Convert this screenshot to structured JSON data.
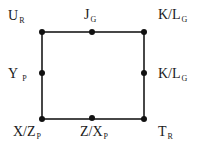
{
  "diagram": {
    "type": "square-lattice",
    "line_color": "#1a1a1a",
    "node_color": "#111111",
    "nodes": [
      {
        "id": "top-left",
        "x": 42,
        "y": 32
      },
      {
        "id": "top-mid",
        "x": 92,
        "y": 32
      },
      {
        "id": "top-right",
        "x": 144,
        "y": 32
      },
      {
        "id": "mid-left",
        "x": 42,
        "y": 73
      },
      {
        "id": "mid-right",
        "x": 144,
        "y": 73
      },
      {
        "id": "bottom-left",
        "x": 42,
        "y": 119
      },
      {
        "id": "bottom-mid",
        "x": 92,
        "y": 118
      },
      {
        "id": "bottom-right",
        "x": 144,
        "y": 119
      }
    ],
    "labels": {
      "top_left": {
        "main": "U",
        "sub": "R"
      },
      "top_mid": {
        "main": "J",
        "sub": "G"
      },
      "top_right": {
        "main": "K/L",
        "sub": "G"
      },
      "mid_left": {
        "main": "Y",
        "sub": "P"
      },
      "mid_right": {
        "main": "K/L",
        "sub": "G"
      },
      "bottom_left": {
        "main": "X/Z",
        "sub": "P"
      },
      "bottom_mid": {
        "main": "Z/X",
        "sub": "P"
      },
      "bottom_right": {
        "main": "T",
        "sub": "R"
      }
    }
  }
}
